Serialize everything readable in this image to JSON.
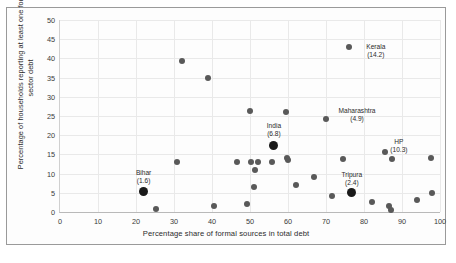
{
  "chart_data": {
    "type": "scatter",
    "title": "",
    "xlabel": "Percentage share of formal sources in total debt",
    "ylabel": "Percentage of households reporting at least one formal sector debt",
    "xlim": [
      0,
      100
    ],
    "ylim": [
      0,
      50
    ],
    "xticks": [
      0,
      10,
      20,
      30,
      40,
      50,
      60,
      70,
      80,
      90,
      100
    ],
    "yticks": [
      0,
      5,
      10,
      15,
      20,
      25,
      30,
      35,
      40,
      45,
      50
    ],
    "grid": true,
    "legend": "none",
    "points": [
      {
        "x": 22.0,
        "y": 5.4,
        "label": "Bihar",
        "value": "(1.6)",
        "highlight": true,
        "label_dx": 0,
        "label_dy": -22
      },
      {
        "x": 25.3,
        "y": 0.8,
        "label": "",
        "value": "",
        "highlight": false
      },
      {
        "x": 30.8,
        "y": 12.9,
        "label": "",
        "value": "",
        "highlight": false
      },
      {
        "x": 32.0,
        "y": 39.2,
        "label": "",
        "value": "",
        "highlight": false
      },
      {
        "x": 39.0,
        "y": 34.9,
        "label": "",
        "value": "",
        "highlight": false
      },
      {
        "x": 40.5,
        "y": 1.6,
        "label": "",
        "value": "",
        "highlight": false
      },
      {
        "x": 46.5,
        "y": 12.9,
        "label": "",
        "value": "",
        "highlight": false
      },
      {
        "x": 50.0,
        "y": 26.3,
        "label": "",
        "value": "",
        "highlight": false
      },
      {
        "x": 50.3,
        "y": 13.0,
        "label": "",
        "value": "",
        "highlight": false
      },
      {
        "x": 52.0,
        "y": 13.0,
        "label": "",
        "value": "",
        "highlight": false
      },
      {
        "x": 51.2,
        "y": 11.0,
        "label": "",
        "value": "",
        "highlight": false
      },
      {
        "x": 51.0,
        "y": 6.4,
        "label": "",
        "value": "",
        "highlight": false
      },
      {
        "x": 49.3,
        "y": 2.1,
        "label": "",
        "value": "",
        "highlight": false
      },
      {
        "x": 56.3,
        "y": 17.2,
        "label": "India",
        "value": "(6.8)",
        "highlight": true,
        "label_dx": 0,
        "label_dy": -24
      },
      {
        "x": 55.8,
        "y": 13.0,
        "label": "",
        "value": "",
        "highlight": false
      },
      {
        "x": 59.5,
        "y": 26.0,
        "label": "",
        "value": "",
        "highlight": false
      },
      {
        "x": 59.8,
        "y": 14.0,
        "label": "",
        "value": "",
        "highlight": false
      },
      {
        "x": 60.0,
        "y": 13.6,
        "label": "",
        "value": "",
        "highlight": false
      },
      {
        "x": 62.0,
        "y": 7.0,
        "label": "",
        "value": "",
        "highlight": false
      },
      {
        "x": 66.8,
        "y": 9.0,
        "label": "",
        "value": "",
        "highlight": false
      },
      {
        "x": 70.0,
        "y": 24.2,
        "label": "Maharashtra",
        "value": "(4.9)",
        "highlight": false,
        "label_dx": 31,
        "label_dy": -12
      },
      {
        "x": 71.5,
        "y": 4.2,
        "label": "",
        "value": "",
        "highlight": false
      },
      {
        "x": 74.5,
        "y": 13.9,
        "label": "",
        "value": "",
        "highlight": false
      },
      {
        "x": 76.0,
        "y": 43.0,
        "label": "Kerala",
        "value": "(14.2)",
        "highlight": false,
        "label_dx": 27,
        "label_dy": -4
      },
      {
        "x": 76.8,
        "y": 5.0,
        "label": "Tripura",
        "value": "(2.4)",
        "highlight": true,
        "label_dx": 0,
        "label_dy": -22
      },
      {
        "x": 82.0,
        "y": 2.7,
        "label": "",
        "value": "",
        "highlight": false
      },
      {
        "x": 85.5,
        "y": 15.5,
        "label": "HP",
        "value": "(10.3)",
        "highlight": false,
        "label_dx": 14,
        "label_dy": -14
      },
      {
        "x": 86.5,
        "y": 1.5,
        "label": "",
        "value": "",
        "highlight": false
      },
      {
        "x": 87.0,
        "y": 0.6,
        "label": "",
        "value": "",
        "highlight": false
      },
      {
        "x": 87.3,
        "y": 13.8,
        "label": "",
        "value": "",
        "highlight": false
      },
      {
        "x": 94.0,
        "y": 3.0,
        "label": "",
        "value": "",
        "highlight": false
      },
      {
        "x": 97.5,
        "y": 14.0,
        "label": "",
        "value": "",
        "highlight": false
      },
      {
        "x": 97.8,
        "y": 5.0,
        "label": "",
        "value": "",
        "highlight": false
      }
    ]
  }
}
